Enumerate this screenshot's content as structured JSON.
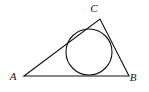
{
  "figure": {
    "kind": "geometry-diagram",
    "background_color": "#ffffff",
    "stroke_color": "#111111",
    "stroke_width": 1.1,
    "canvas": {
      "width": 149,
      "height": 92
    }
  },
  "triangle": {
    "name": "triangle-abc",
    "fill": "none",
    "vertices": [
      {
        "id": "A",
        "label": "A",
        "x": 24,
        "y": 76,
        "label_x": 13,
        "label_y": 80
      },
      {
        "id": "C",
        "label": "C",
        "x": 100,
        "y": 19,
        "label_x": 94,
        "label_y": 12
      },
      {
        "id": "B",
        "label": "B",
        "x": 129,
        "y": 76,
        "label_x": 133,
        "label_y": 81
      }
    ],
    "sides": [
      {
        "id": "AB",
        "from": "A",
        "to": "B"
      },
      {
        "id": "BC",
        "from": "B",
        "to": "C"
      },
      {
        "id": "CA",
        "from": "C",
        "to": "A"
      }
    ]
  },
  "incircle": {
    "name": "inscribed-circle",
    "center_x": 89,
    "center_y": 52,
    "radius": 23,
    "fill": "none"
  }
}
